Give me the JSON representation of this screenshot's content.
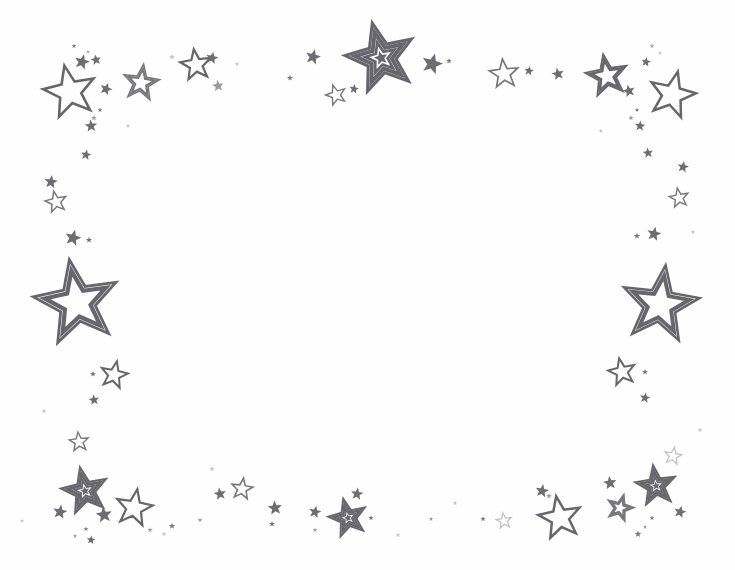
{
  "artwork": {
    "title": "Star Border Frame",
    "description": "Decorative hand-drawn star border clip art",
    "medium": "line art / clip art",
    "orientation": "landscape",
    "width": 735,
    "height": 570
  },
  "colors": {
    "background": "#fefefe",
    "stroke_dark": "#66666c",
    "stroke_mid": "#77777d",
    "stroke_light": "#9b9ba1",
    "stroke_faint": "#c2c2c8",
    "fill_solid": "#6d6d73"
  },
  "center_label": "",
  "composition": {
    "layout": "border-frame",
    "empty_center": true,
    "star_count": 96,
    "regions": [
      "top-left",
      "top-center",
      "top-right",
      "left",
      "right",
      "bottom-left",
      "bottom-center",
      "bottom-right"
    ]
  },
  "stars": [
    {
      "cx": 70,
      "cy": 92,
      "r": 27,
      "rot": -12,
      "style": "outline",
      "weight": 2.6,
      "tone": "stroke_dark"
    },
    {
      "cx": 141,
      "cy": 83,
      "r": 19,
      "rot": 8,
      "style": "double",
      "weight": 1.5,
      "tone": "stroke_mid"
    },
    {
      "cx": 82,
      "cy": 62,
      "r": 8,
      "rot": 15,
      "style": "solid",
      "tone": "fill_solid"
    },
    {
      "cx": 74,
      "cy": 46,
      "r": 2.6,
      "rot": 0,
      "style": "dot",
      "tone": "stroke_mid"
    },
    {
      "cx": 88,
      "cy": 52,
      "r": 2.0,
      "rot": 0,
      "style": "dot",
      "tone": "stroke_light"
    },
    {
      "cx": 96,
      "cy": 60,
      "r": 5.5,
      "rot": -10,
      "style": "solid",
      "tone": "fill_solid"
    },
    {
      "cx": 106,
      "cy": 89,
      "r": 6.5,
      "rot": 20,
      "style": "solid",
      "tone": "fill_solid"
    },
    {
      "cx": 100,
      "cy": 110,
      "r": 2.4,
      "rot": 0,
      "style": "dot",
      "tone": "stroke_mid"
    },
    {
      "cx": 94,
      "cy": 118,
      "r": 3.0,
      "rot": 0,
      "style": "dot",
      "tone": "stroke_light"
    },
    {
      "cx": 91,
      "cy": 126,
      "r": 6.5,
      "rot": -5,
      "style": "solid",
      "tone": "fill_solid"
    },
    {
      "cx": 86,
      "cy": 155,
      "r": 5.5,
      "rot": 10,
      "style": "solid",
      "tone": "fill_solid"
    },
    {
      "cx": 196,
      "cy": 65,
      "r": 16,
      "rot": -8,
      "style": "outline",
      "weight": 2.2,
      "tone": "stroke_dark"
    },
    {
      "cx": 212,
      "cy": 58,
      "r": 6.5,
      "rot": 12,
      "style": "solid",
      "tone": "fill_solid"
    },
    {
      "cx": 218,
      "cy": 86,
      "r": 6.0,
      "rot": -6,
      "style": "solid",
      "tone": "stroke_light"
    },
    {
      "cx": 172,
      "cy": 57,
      "r": 3.0,
      "rot": 0,
      "style": "dot",
      "tone": "stroke_faint"
    },
    {
      "cx": 290,
      "cy": 78,
      "r": 3.2,
      "rot": 0,
      "style": "dot",
      "tone": "stroke_mid"
    },
    {
      "cx": 313,
      "cy": 57,
      "r": 8.0,
      "rot": 14,
      "style": "solid",
      "tone": "fill_solid"
    },
    {
      "cx": 336,
      "cy": 95,
      "r": 10.5,
      "rot": -18,
      "style": "outline",
      "weight": 1.4,
      "tone": "stroke_mid"
    },
    {
      "cx": 354,
      "cy": 89,
      "r": 5.0,
      "rot": 8,
      "style": "solid",
      "tone": "fill_solid"
    },
    {
      "cx": 381,
      "cy": 58,
      "r": 36,
      "rot": -14,
      "style": "triple",
      "weight": 3.0,
      "tone": "stroke_dark"
    },
    {
      "cx": 432,
      "cy": 64,
      "r": 11,
      "rot": 16,
      "style": "solid",
      "tone": "fill_solid"
    },
    {
      "cx": 449,
      "cy": 61,
      "r": 3.0,
      "rot": 0,
      "style": "dot",
      "tone": "stroke_mid"
    },
    {
      "cx": 504,
      "cy": 74,
      "r": 15,
      "rot": -6,
      "style": "outline",
      "weight": 1.7,
      "tone": "stroke_mid"
    },
    {
      "cx": 529,
      "cy": 71,
      "r": 5.0,
      "rot": 10,
      "style": "solid",
      "tone": "fill_solid"
    },
    {
      "cx": 558,
      "cy": 74,
      "r": 6.5,
      "rot": -12,
      "style": "solid",
      "tone": "fill_solid"
    },
    {
      "cx": 607,
      "cy": 76,
      "r": 22,
      "rot": -10,
      "style": "double",
      "weight": 1.8,
      "tone": "stroke_dark"
    },
    {
      "cx": 672,
      "cy": 95,
      "r": 24,
      "rot": 14,
      "style": "outline",
      "weight": 2.5,
      "tone": "stroke_dark"
    },
    {
      "cx": 652,
      "cy": 46,
      "r": 2.4,
      "rot": 0,
      "style": "dot",
      "tone": "stroke_light"
    },
    {
      "cx": 660,
      "cy": 53,
      "r": 2.2,
      "rot": 0,
      "style": "dot",
      "tone": "stroke_faint"
    },
    {
      "cx": 646,
      "cy": 62,
      "r": 5.0,
      "rot": 8,
      "style": "solid",
      "tone": "fill_solid"
    },
    {
      "cx": 629,
      "cy": 91,
      "r": 6.5,
      "rot": -14,
      "style": "solid",
      "tone": "fill_solid"
    },
    {
      "cx": 637,
      "cy": 110,
      "r": 2.3,
      "rot": 0,
      "style": "dot",
      "tone": "stroke_mid"
    },
    {
      "cx": 631,
      "cy": 118,
      "r": 2.8,
      "rot": 0,
      "style": "dot",
      "tone": "stroke_light"
    },
    {
      "cx": 640,
      "cy": 126,
      "r": 5.5,
      "rot": 5,
      "style": "solid",
      "tone": "fill_solid"
    },
    {
      "cx": 648,
      "cy": 153,
      "r": 5.5,
      "rot": -8,
      "style": "solid",
      "tone": "fill_solid"
    },
    {
      "cx": 683,
      "cy": 167,
      "r": 6.0,
      "rot": 10,
      "style": "solid",
      "tone": "fill_solid"
    },
    {
      "cx": 679,
      "cy": 198,
      "r": 10,
      "rot": -10,
      "style": "outline",
      "weight": 1.4,
      "tone": "stroke_mid"
    },
    {
      "cx": 654,
      "cy": 234,
      "r": 7.5,
      "rot": 12,
      "style": "solid",
      "tone": "fill_solid"
    },
    {
      "cx": 637,
      "cy": 236,
      "r": 3.4,
      "rot": 0,
      "style": "dot",
      "tone": "stroke_mid"
    },
    {
      "cx": 51,
      "cy": 182,
      "r": 7.0,
      "rot": 8,
      "style": "solid",
      "tone": "fill_solid"
    },
    {
      "cx": 56,
      "cy": 202,
      "r": 11,
      "rot": -12,
      "style": "outline",
      "weight": 1.5,
      "tone": "stroke_mid"
    },
    {
      "cx": 73,
      "cy": 238,
      "r": 8.5,
      "rot": 14,
      "style": "solid",
      "tone": "fill_solid"
    },
    {
      "cx": 89,
      "cy": 240,
      "r": 3.4,
      "rot": 0,
      "style": "dot",
      "tone": "stroke_mid"
    },
    {
      "cx": 77,
      "cy": 303,
      "r": 44,
      "rot": -10,
      "style": "double",
      "weight": 2.8,
      "tone": "stroke_dark"
    },
    {
      "cx": 114,
      "cy": 375,
      "r": 14,
      "rot": 12,
      "style": "outline",
      "weight": 2.0,
      "tone": "stroke_dark"
    },
    {
      "cx": 93,
      "cy": 374,
      "r": 3.2,
      "rot": 0,
      "style": "dot",
      "tone": "stroke_mid"
    },
    {
      "cx": 94,
      "cy": 400,
      "r": 5.5,
      "rot": -8,
      "style": "solid",
      "tone": "fill_solid"
    },
    {
      "cx": 660,
      "cy": 305,
      "r": 40,
      "rot": 8,
      "style": "double",
      "weight": 2.6,
      "tone": "stroke_dark"
    },
    {
      "cx": 622,
      "cy": 372,
      "r": 14,
      "rot": -12,
      "style": "outline",
      "weight": 2.0,
      "tone": "stroke_dark"
    },
    {
      "cx": 645,
      "cy": 372,
      "r": 3.2,
      "rot": 0,
      "style": "dot",
      "tone": "stroke_mid"
    },
    {
      "cx": 645,
      "cy": 398,
      "r": 5.5,
      "rot": 10,
      "style": "solid",
      "tone": "fill_solid"
    },
    {
      "cx": 79,
      "cy": 442,
      "r": 10,
      "rot": -6,
      "style": "outline",
      "weight": 1.4,
      "tone": "stroke_mid"
    },
    {
      "cx": 85,
      "cy": 491,
      "r": 24,
      "rot": -12,
      "style": "triple",
      "weight": 2.2,
      "tone": "stroke_dark"
    },
    {
      "cx": 60,
      "cy": 512,
      "r": 7.5,
      "rot": 10,
      "style": "solid",
      "tone": "fill_solid"
    },
    {
      "cx": 104,
      "cy": 515,
      "r": 8.5,
      "rot": -8,
      "style": "solid",
      "tone": "fill_solid"
    },
    {
      "cx": 86,
      "cy": 529,
      "r": 2.6,
      "rot": 0,
      "style": "dot",
      "tone": "stroke_mid"
    },
    {
      "cx": 75,
      "cy": 536,
      "r": 2.2,
      "rot": 0,
      "style": "dot",
      "tone": "stroke_light"
    },
    {
      "cx": 91,
      "cy": 540,
      "r": 4.5,
      "rot": 6,
      "style": "solid",
      "tone": "fill_solid"
    },
    {
      "cx": 134,
      "cy": 508,
      "r": 19,
      "rot": 10,
      "style": "outline",
      "weight": 2.2,
      "tone": "stroke_dark"
    },
    {
      "cx": 150,
      "cy": 530,
      "r": 2.8,
      "rot": 0,
      "style": "dot",
      "tone": "stroke_light"
    },
    {
      "cx": 164,
      "cy": 534,
      "r": 2.4,
      "rot": 0,
      "style": "dot",
      "tone": "stroke_faint"
    },
    {
      "cx": 172,
      "cy": 526,
      "r": 3.4,
      "rot": 0,
      "style": "dot",
      "tone": "stroke_mid"
    },
    {
      "cx": 200,
      "cy": 520,
      "r": 2.6,
      "rot": 0,
      "style": "dot",
      "tone": "stroke_light"
    },
    {
      "cx": 220,
      "cy": 494,
      "r": 6.5,
      "rot": -10,
      "style": "solid",
      "tone": "fill_solid"
    },
    {
      "cx": 242,
      "cy": 489,
      "r": 11,
      "rot": 8,
      "style": "outline",
      "weight": 1.6,
      "tone": "stroke_mid"
    },
    {
      "cx": 275,
      "cy": 508,
      "r": 7.5,
      "rot": -6,
      "style": "solid",
      "tone": "fill_solid"
    },
    {
      "cx": 272,
      "cy": 524,
      "r": 3.2,
      "rot": 0,
      "style": "dot",
      "tone": "stroke_mid"
    },
    {
      "cx": 315,
      "cy": 512,
      "r": 6.5,
      "rot": 12,
      "style": "solid",
      "tone": "fill_solid"
    },
    {
      "cx": 315,
      "cy": 530,
      "r": 2.6,
      "rot": 0,
      "style": "dot",
      "tone": "stroke_light"
    },
    {
      "cx": 348,
      "cy": 518,
      "r": 20,
      "rot": -14,
      "style": "triple",
      "weight": 1.9,
      "tone": "stroke_dark"
    },
    {
      "cx": 357,
      "cy": 494,
      "r": 6.5,
      "rot": 8,
      "style": "solid",
      "tone": "fill_solid"
    },
    {
      "cx": 371,
      "cy": 518,
      "r": 2.8,
      "rot": 0,
      "style": "dot",
      "tone": "stroke_mid"
    },
    {
      "cx": 483,
      "cy": 519,
      "r": 2.8,
      "rot": 0,
      "style": "dot",
      "tone": "stroke_mid"
    },
    {
      "cx": 504,
      "cy": 521,
      "r": 8.0,
      "rot": -8,
      "style": "outline",
      "weight": 1.3,
      "tone": "stroke_faint"
    },
    {
      "cx": 542,
      "cy": 491,
      "r": 7.0,
      "rot": 10,
      "style": "solid",
      "tone": "fill_solid"
    },
    {
      "cx": 560,
      "cy": 518,
      "r": 22,
      "rot": -10,
      "style": "outline",
      "weight": 2.5,
      "tone": "stroke_dark"
    },
    {
      "cx": 549,
      "cy": 496,
      "r": 3.0,
      "rot": 0,
      "style": "dot",
      "tone": "stroke_light"
    },
    {
      "cx": 620,
      "cy": 508,
      "r": 14,
      "rot": 16,
      "style": "double",
      "weight": 1.6,
      "tone": "stroke_mid"
    },
    {
      "cx": 610,
      "cy": 483,
      "r": 7.0,
      "rot": -8,
      "style": "solid",
      "tone": "fill_solid"
    },
    {
      "cx": 656,
      "cy": 486,
      "r": 21,
      "rot": -8,
      "style": "triple",
      "weight": 2.0,
      "tone": "stroke_dark"
    },
    {
      "cx": 673,
      "cy": 456,
      "r": 9.0,
      "rot": 10,
      "style": "outline",
      "weight": 1.3,
      "tone": "stroke_faint"
    },
    {
      "cx": 680,
      "cy": 512,
      "r": 6.5,
      "rot": 14,
      "style": "solid",
      "tone": "fill_solid"
    },
    {
      "cx": 652,
      "cy": 518,
      "r": 2.4,
      "rot": 0,
      "style": "dot",
      "tone": "stroke_mid"
    },
    {
      "cx": 645,
      "cy": 527,
      "r": 2.2,
      "rot": 0,
      "style": "dot",
      "tone": "stroke_light"
    },
    {
      "cx": 638,
      "cy": 534,
      "r": 3.6,
      "rot": 0,
      "style": "dot",
      "tone": "stroke_mid"
    },
    {
      "cx": 431,
      "cy": 519,
      "r": 2.4,
      "rot": 0,
      "style": "dot",
      "tone": "stroke_light"
    },
    {
      "cx": 398,
      "cy": 535,
      "r": 2.6,
      "rot": 0,
      "style": "dot",
      "tone": "stroke_faint"
    },
    {
      "cx": 237,
      "cy": 64,
      "r": 2.2,
      "rot": 0,
      "style": "dot",
      "tone": "stroke_faint"
    },
    {
      "cx": 128,
      "cy": 126,
      "r": 2.4,
      "rot": 0,
      "style": "dot",
      "tone": "stroke_faint"
    },
    {
      "cx": 601,
      "cy": 131,
      "r": 2.4,
      "rot": 0,
      "style": "dot",
      "tone": "stroke_faint"
    },
    {
      "cx": 693,
      "cy": 232,
      "r": 2.6,
      "rot": 0,
      "style": "dot",
      "tone": "stroke_faint"
    },
    {
      "cx": 44,
      "cy": 411,
      "r": 2.4,
      "rot": 0,
      "style": "dot",
      "tone": "stroke_faint"
    },
    {
      "cx": 700,
      "cy": 430,
      "r": 2.4,
      "rot": 0,
      "style": "dot",
      "tone": "stroke_faint"
    },
    {
      "cx": 212,
      "cy": 469,
      "r": 2.8,
      "rot": 0,
      "style": "dot",
      "tone": "stroke_faint"
    },
    {
      "cx": 455,
      "cy": 503,
      "r": 2.6,
      "rot": 0,
      "style": "dot",
      "tone": "stroke_faint"
    },
    {
      "cx": 22,
      "cy": 521,
      "r": 2.2,
      "rot": 0,
      "style": "dot",
      "tone": "stroke_faint"
    }
  ]
}
